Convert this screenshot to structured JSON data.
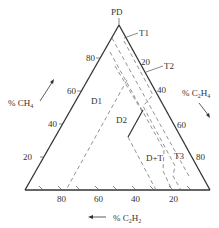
{
  "diagram": {
    "title_apex": "PD",
    "axes": {
      "left": {
        "label": "% CH",
        "sub": "4",
        "ticks": [
          "20",
          "40",
          "60",
          "80"
        ]
      },
      "right": {
        "label": "% C",
        "sub1": "2",
        "mid": "H",
        "sub2": "4",
        "ticks": [
          "20",
          "40",
          "60",
          "80"
        ]
      },
      "bottom": {
        "label": "% C",
        "sub1": "2",
        "mid": "H",
        "sub2": "2",
        "ticks": [
          "80",
          "60",
          "40",
          "20"
        ]
      }
    },
    "zones": [
      "T1",
      "T2",
      "D1",
      "D2",
      "D+T",
      "T3"
    ]
  }
}
